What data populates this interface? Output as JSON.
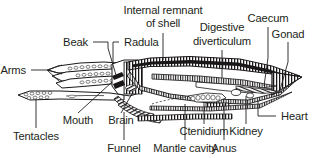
{
  "figure": {
    "background_color": "#ffffff",
    "ink_color": "#231f20",
    "width": 318,
    "height": 158
  },
  "labels": [
    {
      "id": "internal-remnant-of-shell",
      "line1": "Internal remnant",
      "line2": "of shell"
    },
    {
      "id": "caecum",
      "text": "Caecum"
    },
    {
      "id": "digestive-diverticulum",
      "line1": "Digestive",
      "line2": "diverticulum"
    },
    {
      "id": "gonad",
      "text": "Gonad"
    },
    {
      "id": "beak",
      "text": "Beak"
    },
    {
      "id": "radula",
      "text": "Radula"
    },
    {
      "id": "arms",
      "text": "Arms"
    },
    {
      "id": "mouth",
      "text": "Mouth"
    },
    {
      "id": "brain",
      "text": "Brain"
    },
    {
      "id": "tentacles",
      "text": "Tentacles"
    },
    {
      "id": "funnel",
      "text": "Funnel"
    },
    {
      "id": "mantle-cavity",
      "text": "Mantle cavity"
    },
    {
      "id": "ctenidium",
      "text": "Ctenidium"
    },
    {
      "id": "anus",
      "text": "Anus"
    },
    {
      "id": "kidney",
      "text": "Kidney"
    },
    {
      "id": "heart",
      "text": "Heart"
    }
  ],
  "text": {
    "internal_remnant_1": "Internal remnant",
    "internal_remnant_2": "of shell",
    "caecum": "Caecum",
    "digestive_1": "Digestive",
    "digestive_2": "diverticulum",
    "gonad": "Gonad",
    "beak": "Beak",
    "radula": "Radula",
    "arms": "Arms",
    "mouth": "Mouth",
    "brain": "Brain",
    "tentacles": "Tentacles",
    "funnel": "Funnel",
    "mantle_cavity": "Mantle cavity",
    "ctenidium": "Ctenidium",
    "anus": "Anus",
    "kidney": "Kidney",
    "heart": "Heart"
  }
}
